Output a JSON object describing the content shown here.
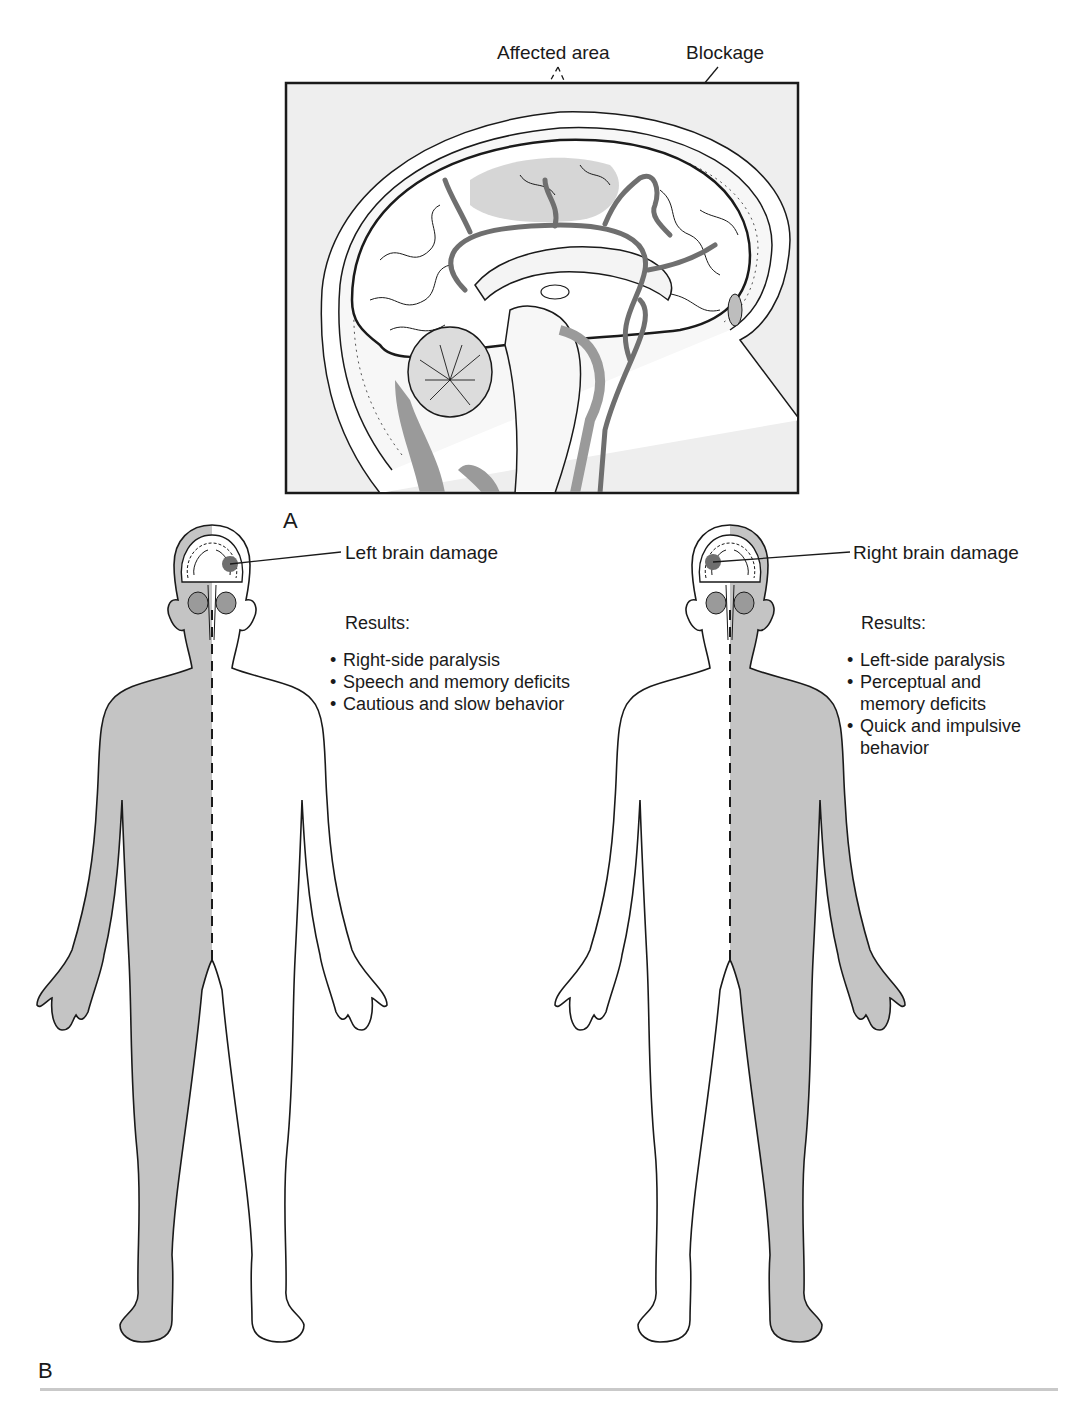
{
  "figure": {
    "panel_a": {
      "letter": "A",
      "callouts": {
        "affected_area": "Affected area",
        "blockage": "Blockage"
      },
      "illustration": "sagittal-brain-section"
    },
    "panel_b": {
      "letter": "B",
      "left_figure": {
        "damage_label": "Left brain damage",
        "results_title": "Results:",
        "results": [
          "Right-side paralysis",
          "Speech and memory deficits",
          "Cautious and slow behavior"
        ],
        "paralyzed_side": "right"
      },
      "right_figure": {
        "damage_label": "Right brain damage",
        "results_title": "Results:",
        "results": [
          "Left-side paralysis",
          "Perceptual and memory deficits",
          "Quick and impulsive behavior"
        ],
        "paralyzed_side": "left"
      }
    },
    "colors": {
      "shaded": "#c4c4c4",
      "vessel": "#7a7a7a",
      "frame_bg": "#eeeeee",
      "lesion": "#6e6e6e",
      "ink": "#1a1a1a"
    }
  }
}
